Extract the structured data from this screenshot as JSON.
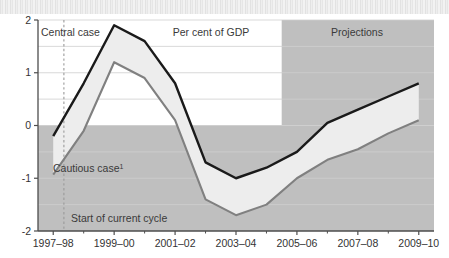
{
  "figure": {
    "banner_label": "",
    "background_color": "#ffffff"
  },
  "annotations": {
    "central_case": "Central case",
    "cautious_case": "Cautious case",
    "cautious_case_superscript": "1",
    "units": "Per cent of GDP",
    "projections": "Projections",
    "cycle_start": "Start of current cycle"
  },
  "colors": {
    "central_line": "#1a1a1a",
    "cautious_line": "#808080",
    "band_fill": "#ededed",
    "projection_shade": "#bfbfbf",
    "below_zero_shade": "#bfbfbf",
    "gridline": "#cfcfcf",
    "axis": "#4d4d4d",
    "dashed_marker": "#9a9a9a"
  },
  "axis": {
    "y_ticks": [
      "2",
      "1",
      "0",
      "-1",
      "-2"
    ],
    "y_tick_values": [
      2,
      1,
      0,
      -1,
      -2
    ],
    "y_minor_values": [
      1.5,
      0.5,
      -0.5,
      -1.5
    ],
    "ylim": [
      -2,
      2
    ],
    "x_labels": [
      "1997–98",
      "1999–00",
      "2001–02",
      "2003–04",
      "2005–06",
      "2007–08",
      "2009–10"
    ],
    "x_label_values": [
      1997,
      1999,
      2001,
      2003,
      2005,
      2007,
      2009
    ],
    "xlim": [
      1997,
      2010
    ]
  },
  "chart_data": {
    "type": "line",
    "title": "",
    "subtitle": "",
    "xlabel": "",
    "ylabel": "Per cent of GDP",
    "ylim": [
      -2,
      2
    ],
    "xlim": [
      1997,
      2010
    ],
    "grid": true,
    "legend": "inline-annotations",
    "x": [
      "1997-98",
      "1998-99",
      "1999-00",
      "2000-01",
      "2001-02",
      "2002-03",
      "2003-04",
      "2004-05",
      "2005-06",
      "2006-07",
      "2007-08",
      "2008-09",
      "2009-10"
    ],
    "x_numeric": [
      1997,
      1998,
      1999,
      2000,
      2001,
      2002,
      2003,
      2004,
      2005,
      2006,
      2007,
      2008,
      2009
    ],
    "series": [
      {
        "name": "Central case",
        "color": "#1a1a1a",
        "values": [
          -0.2,
          0.8,
          1.9,
          1.6,
          0.8,
          -0.7,
          -1.0,
          -0.8,
          -0.5,
          0.05,
          0.3,
          0.55,
          0.8
        ]
      },
      {
        "name": "Cautious case",
        "color": "#808080",
        "values": [
          -0.93,
          -0.1,
          1.2,
          0.9,
          0.1,
          -1.4,
          -1.7,
          -1.5,
          -1.0,
          -0.65,
          -0.45,
          -0.15,
          0.1
        ]
      }
    ],
    "band_between_series": true,
    "shaded_regions": [
      {
        "name": "projections",
        "x_start": "2005-06",
        "x_start_numeric": 2005,
        "x_end_numeric": 2010,
        "label": "Projections",
        "color": "#bfbfbf"
      },
      {
        "name": "below-zero",
        "y_start": -2,
        "y_end": 0,
        "color": "#bfbfbf"
      }
    ],
    "markers": [
      {
        "name": "start-of-current-cycle",
        "type": "vline",
        "x_numeric": 1997.85,
        "label": "Start of current cycle",
        "style": "dashed",
        "color": "#9a9a9a"
      }
    ]
  }
}
